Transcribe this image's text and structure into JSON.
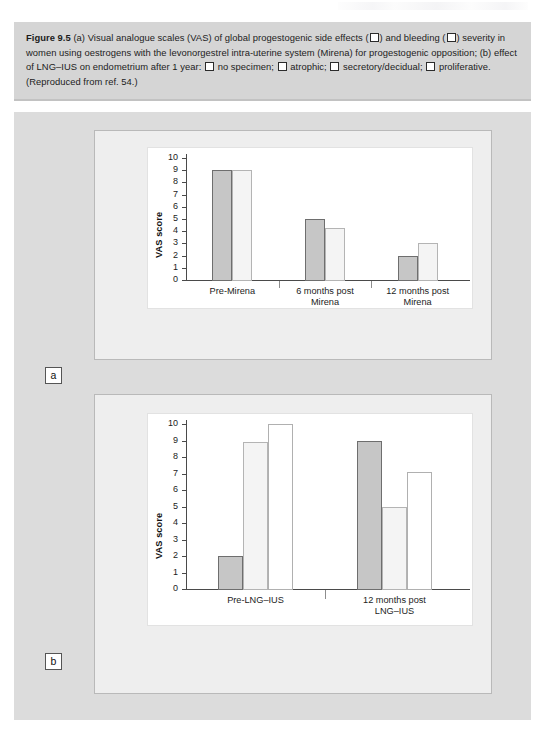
{
  "caption": {
    "figure_number": "Figure 9.5",
    "segments": [
      {
        "t": "text",
        "v": " (a) Visual analogue scales (VAS) of global progestogenic side effects ("
      },
      {
        "t": "box"
      },
      {
        "t": "text",
        "v": ") and bleeding ("
      },
      {
        "t": "box"
      },
      {
        "t": "text",
        "v": ") severity in women using oestrogens with the levonorgestrel intra-uterine system (Mirena) for progestogenic opposition; (b) effect of LNG–IUS on endometrium after 1 year: "
      },
      {
        "t": "box"
      },
      {
        "t": "text",
        "v": " no specimen; "
      },
      {
        "t": "box"
      },
      {
        "t": "text",
        "v": " atrophic; "
      },
      {
        "t": "box"
      },
      {
        "t": "text",
        "v": " secretory/decidual; "
      },
      {
        "t": "box"
      },
      {
        "t": "text",
        "v": " proliferative. (Reproduced from ref. 54.)"
      }
    ],
    "full_text": "Figure 9.5 (a) Visual analogue scales (VAS) of global progestogenic side effects (□) and bleeding (□) severity in women using oestrogens with the levonorgestrel intra-uterine system (Mirena) for progestogenic opposition; (b) effect of LNG–IUS on endometrium after 1 year: □ no specimen; □ atrophic; □ secretory/decidual; □ proliferative. (Reproduced from ref. 54.)"
  },
  "panels": {
    "a_label": "a",
    "b_label": "b"
  },
  "colors": {
    "caption_background": "#d5d5d5",
    "figure_background": "#dcdcdc",
    "card_background": "#eeeeee",
    "plot_background": "#ffffff",
    "bar_dark": "#c6c6c6",
    "bar_light": "#f4f4f4",
    "bar_white": "#ffffff",
    "axis": "#4a4a4a"
  },
  "chart_data": [
    {
      "type": "bar",
      "panel": "a",
      "title": "",
      "xlabel": "",
      "ylabel": "VAS score",
      "ylim": [
        0,
        10
      ],
      "yticks": [
        0,
        1,
        2,
        3,
        4,
        5,
        6,
        7,
        8,
        9,
        10
      ],
      "ytick_labels": [
        "0",
        "1",
        "2",
        "3",
        "4",
        "5",
        "6",
        "7",
        "8",
        "9",
        "10"
      ],
      "grid": false,
      "legend_position": "caption",
      "categories": [
        "Pre-Mirena",
        "6 months post\nMirena",
        "12 months post\nMirena"
      ],
      "series": [
        {
          "name": "global progestogenic side effects",
          "fill": "dark",
          "values": [
            9.0,
            5.0,
            2.0
          ]
        },
        {
          "name": "bleeding severity",
          "fill": "light",
          "values": [
            9.0,
            4.3,
            3.0
          ]
        }
      ]
    },
    {
      "type": "bar",
      "panel": "b",
      "title": "",
      "xlabel": "",
      "ylabel": "VAS score",
      "ylim": [
        0,
        10
      ],
      "yticks": [
        0,
        1,
        2,
        3,
        4,
        5,
        6,
        7,
        8,
        9,
        10
      ],
      "ytick_labels": [
        "0",
        "1",
        "2",
        "3",
        "4",
        "5",
        "6",
        "7",
        "8",
        "9",
        "10"
      ],
      "grid": false,
      "legend_position": "caption",
      "categories": [
        "Pre-LNG–IUS",
        "12 months post\nLNG–IUS"
      ],
      "series": [
        {
          "name": "no specimen",
          "fill": "dark",
          "values": [
            2.0,
            9.0
          ]
        },
        {
          "name": "atrophic",
          "fill": "light",
          "values": [
            8.9,
            5.0
          ]
        },
        {
          "name": "secretory/decidual",
          "fill": "white",
          "values": [
            10.0,
            7.1
          ]
        }
      ]
    }
  ]
}
